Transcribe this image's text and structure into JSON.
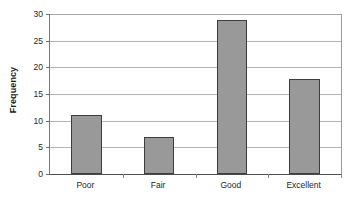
{
  "chart_data": {
    "type": "bar",
    "title": "",
    "subtitle": "",
    "xlabel": "",
    "ylabel": "Frequency",
    "categories": [
      "Poor",
      "Fair",
      "Good",
      "Excellent"
    ],
    "values": [
      11,
      7,
      28.8,
      17.8
    ],
    "ylim": [
      0,
      30
    ],
    "yticks": [
      0,
      5,
      10,
      15,
      20,
      25,
      30
    ],
    "ytick_labels": [
      "0",
      "5",
      "10",
      "15",
      "20",
      "25",
      "30"
    ],
    "grid": true,
    "grid_axis": "y",
    "legend": false,
    "legend_position": "none",
    "bar_color": "#999999",
    "bar_edge_color": "#3d3d3d",
    "gridline_color": "#b4b4b4",
    "axis_color": "#4d4d4d",
    "plot_background": "#ffffff",
    "figure_background": "#ffffff",
    "text_color": "#262626"
  }
}
